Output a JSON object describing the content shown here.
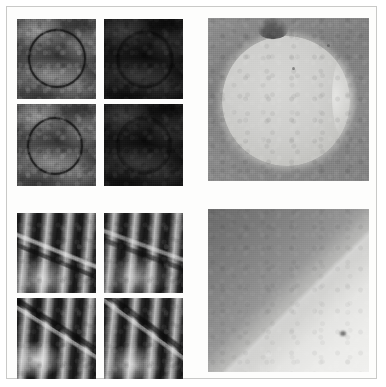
{
  "figure": {
    "kind": "microscopy-figure",
    "width": 386,
    "height": 387,
    "background_color": "#ffffff",
    "frame_color": "#c9c9c7",
    "caption": ""
  },
  "panels": [
    {
      "id": "top-left-grid",
      "name": "top-left-micrograph-grid",
      "type": "image-grid",
      "rows": 2,
      "columns": 2,
      "description": "Dark grey transmission electron micrographs showing a circular ring outline",
      "x": 16,
      "y": 18,
      "width": 166,
      "height": 167,
      "cells": [
        {
          "id": "tl-r1c1",
          "name": "micrograph-top-left-1",
          "label": "",
          "brightness": "normal",
          "feature": "dark circular ring outline, upper-left of cell",
          "ring": {
            "left_pct": 14,
            "top_pct": 13,
            "size_pct": 68,
            "visible": true
          }
        },
        {
          "id": "tl-r1c2",
          "name": "micrograph-top-left-2",
          "label": "",
          "brightness": "dim",
          "feature": "faint mottled texture, ring barely visible",
          "ring": {
            "left_pct": 16,
            "top_pct": 15,
            "size_pct": 66,
            "visible": false
          }
        },
        {
          "id": "tl-r2c1",
          "name": "micrograph-top-left-3",
          "label": "",
          "brightness": "normal",
          "feature": "dark circular ring outline, centred slightly left",
          "ring": {
            "left_pct": 13,
            "top_pct": 16,
            "size_pct": 66,
            "visible": true
          }
        },
        {
          "id": "tl-r2c2",
          "name": "micrograph-top-left-4",
          "label": "",
          "brightness": "dim",
          "feature": "uniform dark mottled texture",
          "ring": {
            "left_pct": 16,
            "top_pct": 16,
            "size_pct": 64,
            "visible": false
          }
        }
      ]
    },
    {
      "id": "top-right-panel",
      "name": "top-right-micrograph",
      "type": "image",
      "description": "Large bright spherical particle on mid-grey background with dark notch at the top and bright rim on the right",
      "x": 207,
      "y": 17,
      "width": 161,
      "height": 163,
      "label": ""
    },
    {
      "id": "bottom-left-grid",
      "name": "bottom-left-micrograph-grid",
      "type": "image-grid",
      "rows": 2,
      "columns": 2,
      "description": "High-resolution lattice-fringe micrographs with near-vertical stripes crossed by a diagonal defect line",
      "x": 16,
      "y": 212,
      "width": 166,
      "height": 166,
      "cells": [
        {
          "id": "bl-r1c1",
          "name": "micrograph-bottom-left-1",
          "label": "",
          "feature": "vertical lattice fringes with diagonal bright/dark boundary across upper half"
        },
        {
          "id": "bl-r1c2",
          "name": "micrograph-bottom-left-2",
          "label": "",
          "feature": "vertical lattice fringes with diagonal boundary across centre"
        },
        {
          "id": "bl-r2c1",
          "name": "micrograph-bottom-left-3",
          "label": "",
          "feature": "vertical lattice fringes with sharp dark diagonal line and bright patch lower-left"
        },
        {
          "id": "bl-r2c2",
          "name": "micrograph-bottom-left-4",
          "label": "",
          "feature": "vertical lattice fringes with sharp dark diagonal line through centre"
        }
      ]
    },
    {
      "id": "bottom-right-panel",
      "name": "bottom-right-micrograph",
      "type": "image",
      "description": "Smooth diagonal intensity boundary, bright lower-left region meeting darker upper-right region",
      "x": 207,
      "y": 208,
      "width": 161,
      "height": 163,
      "label": ""
    }
  ]
}
